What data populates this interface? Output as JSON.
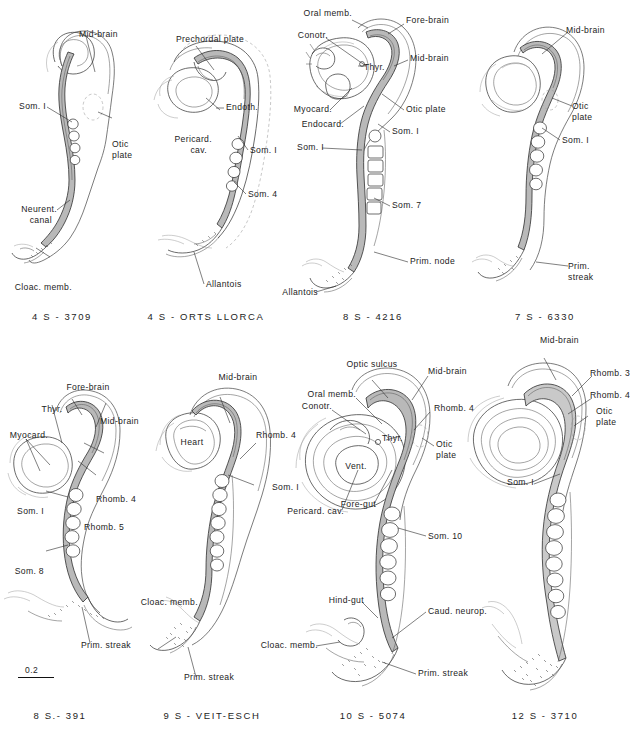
{
  "figure": {
    "kind": "plate",
    "background_color": "#ffffff",
    "ink_color": "#232323",
    "scale_bar": {
      "value": "0.2",
      "name": "scale-bar"
    }
  },
  "panels": [
    {
      "id": "p1",
      "caption": "4 S - 3709",
      "labels": [
        {
          "text": "Mid-brain",
          "align": "left"
        },
        {
          "text": "Som. I",
          "align": "right"
        },
        {
          "text": "Otic",
          "align": "left"
        },
        {
          "text": "plate",
          "align": "left"
        },
        {
          "text": "Neurent.",
          "align": "right"
        },
        {
          "text": "canal",
          "align": "right"
        },
        {
          "text": "Cloac. memb.",
          "align": "right"
        }
      ]
    },
    {
      "id": "p2",
      "caption": "4 S - ORTS LLORCA",
      "labels": [
        {
          "text": "Prechordal plate",
          "align": "left"
        },
        {
          "text": "Endoth.",
          "align": "left"
        },
        {
          "text": "Pericard.",
          "align": "right"
        },
        {
          "text": "cav.",
          "align": "right"
        },
        {
          "text": "Som. I",
          "align": "left"
        },
        {
          "text": "Som. 4",
          "align": "left"
        },
        {
          "text": "Allantois",
          "align": "left"
        }
      ]
    },
    {
      "id": "p3",
      "caption": "8 S - 4216",
      "labels": [
        {
          "text": "Oral memb.",
          "align": "right"
        },
        {
          "text": "Fore-brain",
          "align": "left"
        },
        {
          "text": "Conotr.",
          "align": "right"
        },
        {
          "text": "Mid-brain",
          "align": "left"
        },
        {
          "text": "Thyr.",
          "align": "left"
        },
        {
          "text": "Myocard.",
          "align": "right"
        },
        {
          "text": "Endocard.",
          "align": "right"
        },
        {
          "text": "Otic plate",
          "align": "left"
        },
        {
          "text": "Som. I",
          "align": "left"
        },
        {
          "text": "Som. I",
          "align": "right"
        },
        {
          "text": "Som. 7",
          "align": "left"
        },
        {
          "text": "Prim. node",
          "align": "left"
        },
        {
          "text": "Allantois",
          "align": "right"
        }
      ]
    },
    {
      "id": "p4",
      "caption": "7 S - 6330",
      "labels": [
        {
          "text": "Mid-brain",
          "align": "left"
        },
        {
          "text": "Otic",
          "align": "left"
        },
        {
          "text": "plate",
          "align": "left"
        },
        {
          "text": "Som. I",
          "align": "left"
        },
        {
          "text": "Prim.",
          "align": "left"
        },
        {
          "text": "streak",
          "align": "left"
        }
      ]
    },
    {
      "id": "p5",
      "caption": "8 S.- 391",
      "labels": [
        {
          "text": "Fore-brain",
          "align": "center"
        },
        {
          "text": "Thyr.",
          "align": "center"
        },
        {
          "text": "Mid-brain",
          "align": "left"
        },
        {
          "text": "Myocard.",
          "align": "right"
        },
        {
          "text": "Rhomb. 4",
          "align": "left"
        },
        {
          "text": "Som. I",
          "align": "right"
        },
        {
          "text": "Rhomb. 5",
          "align": "left"
        },
        {
          "text": "Som. 8",
          "align": "right"
        },
        {
          "text": "Prim. streak",
          "align": "left"
        }
      ]
    },
    {
      "id": "p6",
      "caption": "9 S - VEIT-ESCH",
      "labels": [
        {
          "text": "Mid-brain",
          "align": "center"
        },
        {
          "text": "Heart",
          "align": "center"
        },
        {
          "text": "Rhomb. 4",
          "align": "left"
        },
        {
          "text": "Som. I",
          "align": "left"
        },
        {
          "text": "Cloac. memb.",
          "align": "right"
        },
        {
          "text": "Prim. streak",
          "align": "left"
        }
      ]
    },
    {
      "id": "p7",
      "caption": "10 S - 5074",
      "labels": [
        {
          "text": "Optic sulcus",
          "align": "center"
        },
        {
          "text": "Mid-brain",
          "align": "left"
        },
        {
          "text": "Oral memb.",
          "align": "right"
        },
        {
          "text": "Conotr.",
          "align": "right"
        },
        {
          "text": "Rhomb. 4",
          "align": "left"
        },
        {
          "text": "Thyr.",
          "align": "left"
        },
        {
          "text": "Vent.",
          "align": "center"
        },
        {
          "text": "Otic",
          "align": "left"
        },
        {
          "text": "plate",
          "align": "left"
        },
        {
          "text": "Pericard. cav.",
          "align": "right"
        },
        {
          "text": "Fore-gut",
          "align": "right"
        },
        {
          "text": "Som. 10",
          "align": "left"
        },
        {
          "text": "Hind-gut",
          "align": "right"
        },
        {
          "text": "Cloac. memb.",
          "align": "right"
        },
        {
          "text": "Caud. neurop.",
          "align": "left"
        },
        {
          "text": "Prim. streak",
          "align": "left"
        }
      ]
    },
    {
      "id": "p8",
      "caption": "12 S - 3710",
      "labels": [
        {
          "text": "Mid-brain",
          "align": "left"
        },
        {
          "text": "Rhomb. 3",
          "align": "left"
        },
        {
          "text": "Rhomb. 4",
          "align": "left"
        },
        {
          "text": "Otic",
          "align": "left"
        },
        {
          "text": "plate",
          "align": "left"
        },
        {
          "text": "Som. I",
          "align": "right"
        }
      ]
    }
  ]
}
